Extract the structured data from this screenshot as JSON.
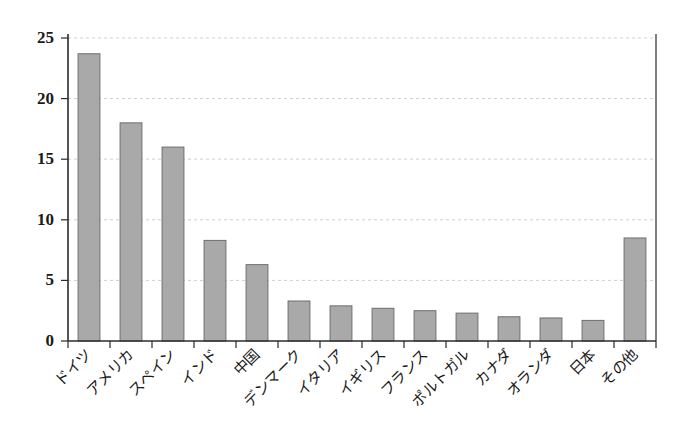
{
  "chart_data": {
    "type": "bar",
    "title": "",
    "subtitle": "",
    "xlabel": "",
    "ylabel": "",
    "categories": [
      "ドイツ",
      "アメリカ",
      "スペイン",
      "インド",
      "中国",
      "デンマーク",
      "イタリア",
      "イギリス",
      "フランス",
      "ポルトガル",
      "カナダ",
      "オランダ",
      "日本",
      "その他"
    ],
    "values": [
      23.7,
      18.0,
      16.0,
      8.3,
      6.3,
      3.3,
      2.9,
      2.7,
      2.5,
      2.3,
      2.0,
      1.9,
      1.7,
      8.5
    ],
    "ylim": [
      0,
      25
    ],
    "yticks": [
      0,
      5,
      10,
      15,
      20,
      25
    ],
    "ytick_labels": [
      "0",
      "5",
      "10",
      "15",
      "20",
      "25"
    ],
    "grid": true,
    "grid_axis": "y",
    "legend": null,
    "bar_color": "#a9a9a9",
    "bar_edge_color": "#6e6e6e",
    "grid_color": "#cfcfcf",
    "axis_color": "#2b2b2b",
    "xtick_rotation": 45
  }
}
